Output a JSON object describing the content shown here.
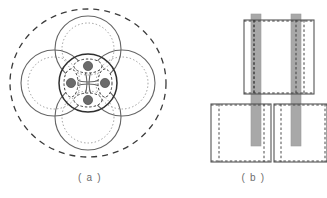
{
  "figure": {
    "width": 327,
    "height": 198,
    "background": "#ffffff"
  },
  "captions": {
    "panel_a": "( a )",
    "panel_b": "( b )",
    "color": "#6d6d6d"
  },
  "colors": {
    "solid_stroke": "#555555",
    "dark_stroke": "#333333",
    "dotted_stroke": "#9a9a9a",
    "dashed_stroke": "#3b3b3b",
    "dot_fill": "#6b6b6b",
    "dot_stroke": "#4a4a4a",
    "bar_fill": "#a8a8a8",
    "bar_stroke": "#8e8e8e",
    "rect_stroke": "#555555",
    "rect_dashed": "#4a4a4a"
  },
  "panel_a": {
    "center": {
      "x": 88,
      "y": 83
    },
    "outer_boundary": {
      "name": "outer-dashed-ellipse",
      "rx": 78,
      "ry": 74,
      "style": "dashed",
      "dash": "6 5"
    },
    "petals": [
      {
        "name": "petal-top",
        "cx": 88,
        "cy": 49,
        "r_solid": 33,
        "r_dotted": 26
      },
      {
        "name": "petal-right",
        "cx": 122,
        "cy": 83,
        "r_solid": 33,
        "r_dotted": 26
      },
      {
        "name": "petal-bottom",
        "cx": 88,
        "cy": 117,
        "r_solid": 33,
        "r_dotted": 26
      },
      {
        "name": "petal-left",
        "cx": 54,
        "cy": 83,
        "r_solid": 33,
        "r_dotted": 26
      }
    ],
    "core": {
      "name": "core-circle",
      "cx": 88,
      "cy": 83,
      "r_solid": 29,
      "r_dotted": 22
    },
    "lenses": [
      {
        "name": "lens-top",
        "cx": 88,
        "cy": 66,
        "rx": 14,
        "ry": 7,
        "angle": 0,
        "dot": {
          "cx": 88,
          "cy": 66,
          "r": 4.6
        }
      },
      {
        "name": "lens-right",
        "cx": 105,
        "cy": 83,
        "rx": 7,
        "ry": 14,
        "angle": 0,
        "dot": {
          "cx": 105,
          "cy": 83,
          "r": 4.6
        }
      },
      {
        "name": "lens-bottom",
        "cx": 88,
        "cy": 100,
        "rx": 14,
        "ry": 7,
        "angle": 0,
        "dot": {
          "cx": 88,
          "cy": 100,
          "r": 4.6
        }
      },
      {
        "name": "lens-left",
        "cx": 71,
        "cy": 83,
        "rx": 7,
        "ry": 14,
        "angle": 0,
        "dot": {
          "cx": 71,
          "cy": 83,
          "r": 4.6
        }
      }
    ]
  },
  "panel_b": {
    "top_plate": {
      "name": "top-plate-rect",
      "x": 244,
      "y": 20,
      "width": 70,
      "height": 74,
      "inner_dashed_left_x": 254,
      "inner_dashed_right_x": 304
    },
    "bottom_left_plate": {
      "name": "bottom-left-plate-rect",
      "x": 211,
      "y": 104,
      "width": 60,
      "height": 58,
      "inner_dashed_left_x": 219,
      "inner_dashed_right_x": 264
    },
    "bottom_right_plate": {
      "name": "bottom-right-plate-rect",
      "x": 274,
      "y": 104,
      "width": 60,
      "height": 58,
      "inner_dashed_left_x": 281,
      "inner_dashed_right_x": 326
    },
    "bars": [
      {
        "name": "vertical-bar-left",
        "x": 251,
        "y": 14,
        "width": 10,
        "height": 132
      },
      {
        "name": "vertical-bar-right",
        "x": 291,
        "y": 14,
        "width": 10,
        "height": 132
      }
    ]
  }
}
